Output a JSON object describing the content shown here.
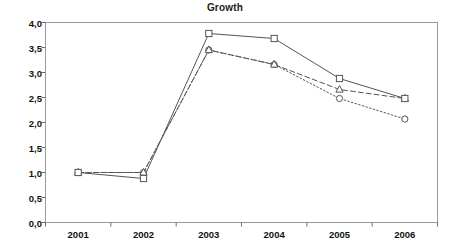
{
  "chart_data": {
    "type": "line",
    "title": "Growth",
    "xlabel": "",
    "ylabel": "",
    "categories": [
      "2001",
      "2002",
      "2003",
      "2004",
      "2005",
      "2006"
    ],
    "x": [
      2001,
      2002,
      2003,
      2004,
      2005,
      2006
    ],
    "ylim": [
      0.0,
      4.0
    ],
    "ytick_labels": [
      "0,0",
      "0,5",
      "1,0",
      "1,5",
      "2,0",
      "2,5",
      "3,0",
      "3,5",
      "4,0"
    ],
    "ytick_values": [
      0.0,
      0.5,
      1.0,
      1.5,
      2.0,
      2.5,
      3.0,
      3.5,
      4.0
    ],
    "grid": false,
    "legend": "none",
    "decimal_separator": ",",
    "series": [
      {
        "name": "series-square",
        "marker": "square",
        "line_style": "solid",
        "color": "#555555",
        "values": [
          1.0,
          0.88,
          3.78,
          3.68,
          2.88,
          2.48
        ]
      },
      {
        "name": "series-triangle",
        "marker": "triangle",
        "line_style": "dashed",
        "color": "#555555",
        "values": [
          1.0,
          1.0,
          3.45,
          3.16,
          2.66,
          2.48
        ]
      },
      {
        "name": "series-circle",
        "marker": "circle",
        "line_style": "dotted",
        "color": "#555555",
        "values": [
          1.0,
          1.0,
          3.45,
          3.16,
          2.48,
          2.07
        ]
      }
    ]
  },
  "axes": {
    "frame_color": "#9a9a9a",
    "tick_color": "#6d6d6d"
  }
}
